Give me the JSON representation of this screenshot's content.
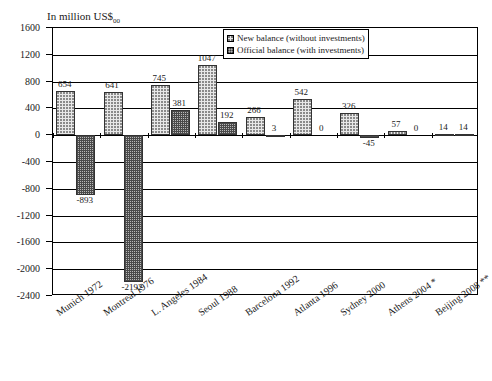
{
  "chart_data": {
    "type": "bar",
    "title": "",
    "axis_title": "In million US$",
    "axis_title_subscript": "00",
    "xlabel": "",
    "ylabel": "",
    "ylim": [
      -2400,
      1600
    ],
    "ytick_step": 400,
    "grid": true,
    "legend_position": "top-right",
    "categories": [
      "Munich 1972",
      "Montreal 1976",
      "L. Angeles 1984",
      "Seoul  1988",
      "Barcelona 1992",
      "Atlanta 1996",
      "Sydney 2000",
      "Athens 2004 *",
      "Beijing 2008 **"
    ],
    "ytick_labels": [
      "1600",
      "1200",
      "800",
      "400",
      "0",
      "-400",
      "-800",
      "-1200",
      "-1600",
      "-2000",
      "-2400"
    ],
    "ytick_values": [
      1600,
      1200,
      800,
      400,
      0,
      -400,
      -800,
      -1200,
      -1600,
      -2000,
      -2400
    ],
    "series": [
      {
        "name": "New balance (without investments)",
        "values": [
          654,
          641,
          745,
          1047,
          266,
          542,
          326,
          57,
          14
        ],
        "labels": [
          "654",
          "641",
          "745",
          "1047",
          "266",
          "542",
          "326",
          "57",
          "14"
        ]
      },
      {
        "name": "Official balance (with investments)",
        "values": [
          -893,
          -2192,
          381,
          192,
          3,
          0,
          -45,
          0,
          14
        ],
        "labels": [
          "-893",
          "-2192",
          "381",
          "192",
          "3",
          "0",
          "-45",
          "0",
          "14"
        ]
      }
    ]
  },
  "legend": {
    "items": [
      {
        "label": "New balance (without investments)",
        "pattern": "light-dots"
      },
      {
        "label": "Official balance (with investments)",
        "pattern": "dark-dots"
      }
    ]
  },
  "colors": {
    "axis": "#000000",
    "grid": "#000000",
    "new_balance_fill": "#e8e8e8",
    "official_balance_fill": "#b8b8b8",
    "background": "#ffffff"
  }
}
